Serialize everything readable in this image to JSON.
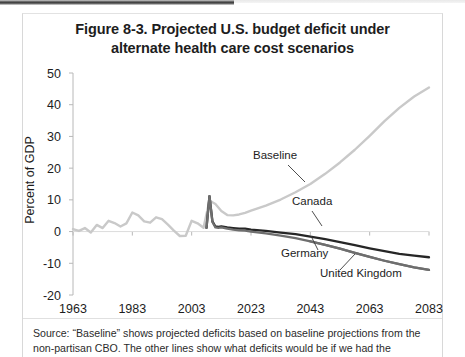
{
  "document": {
    "source_note": "Source: “Baseline” shows projected deficits based on baseline projections from the non-partisan CBO. The other lines show what deficits would be if we had the"
  },
  "chart_data": {
    "type": "line",
    "title": "Figure 8-3. Projected U.S. budget deficit under alternate health care cost scenarios",
    "title_line_1": "Figure 8-3. Projected U.S. budget deficit under",
    "title_line_2": "alternate health care cost scenarios",
    "xlabel": "",
    "ylabel": "Percent of GDP",
    "xlim": [
      1963,
      2083
    ],
    "ylim": [
      -20,
      50
    ],
    "xticks": [
      1963,
      1983,
      2003,
      2023,
      2043,
      2063,
      2083
    ],
    "yticks": [
      50,
      40,
      30,
      20,
      10,
      0,
      -10,
      -20
    ],
    "grid": false,
    "zero_line": 0,
    "legend": "inline-annotations",
    "colors": {
      "baseline": "#c9c9c9",
      "canada": "#262626",
      "germany": "#6e6e6e",
      "united_kingdom": "#6e6e6e",
      "axis": "#b8b8b8",
      "text": "#1d1d1d"
    },
    "annotations": [
      {
        "label": "Baseline",
        "x": 253,
        "y": 159
      },
      {
        "label": "Canada",
        "x": 292,
        "y": 205
      },
      {
        "label": "Germany",
        "x": 281,
        "y": 257
      },
      {
        "label": "United Kingdom",
        "x": 320,
        "y": 277
      }
    ],
    "series": [
      {
        "name": "Baseline",
        "color": "#c9c9c9",
        "x": [
          1963,
          1965,
          1967,
          1969,
          1971,
          1973,
          1975,
          1977,
          1979,
          1981,
          1983,
          1985,
          1987,
          1989,
          1991,
          1993,
          1995,
          1997,
          1999,
          2001,
          2003,
          2005,
          2007,
          2009,
          2011,
          2013,
          2015,
          2017,
          2019,
          2021,
          2023,
          2028,
          2033,
          2038,
          2043,
          2048,
          2053,
          2058,
          2063,
          2068,
          2073,
          2078,
          2083
        ],
        "values": [
          0.8,
          0.2,
          1.1,
          -0.3,
          2.1,
          1.1,
          3.4,
          2.7,
          1.6,
          2.6,
          6.0,
          5.1,
          3.2,
          2.8,
          4.5,
          3.9,
          2.2,
          0.3,
          -1.4,
          -1.3,
          3.4,
          2.6,
          1.2,
          9.8,
          8.7,
          6.5,
          5.2,
          5.1,
          5.4,
          5.9,
          6.6,
          8.2,
          10.1,
          12.4,
          15.0,
          18.2,
          21.8,
          25.8,
          30.2,
          34.8,
          39.0,
          42.6,
          45.4
        ]
      },
      {
        "name": "Canada",
        "color": "#262626",
        "x": [
          2008,
          2009,
          2010,
          2011,
          2012,
          2013,
          2015,
          2017,
          2019,
          2021,
          2023,
          2028,
          2033,
          2038,
          2043,
          2048,
          2053,
          2058,
          2063,
          2068,
          2073,
          2078,
          2083
        ],
        "values": [
          1.2,
          11.2,
          3.2,
          1.6,
          1.5,
          1.6,
          1.3,
          1.1,
          0.9,
          0.9,
          0.6,
          0.2,
          -0.3,
          -0.8,
          -1.6,
          -2.4,
          -3.3,
          -4.3,
          -5.3,
          -6.2,
          -7.0,
          -7.6,
          -8.1
        ]
      },
      {
        "name": "Germany",
        "color": "#6e6e6e",
        "x": [
          2008,
          2009,
          2010,
          2011,
          2012,
          2013,
          2015,
          2017,
          2019,
          2021,
          2023,
          2028,
          2033,
          2038,
          2043,
          2048,
          2053,
          2058,
          2063,
          2068,
          2073,
          2078,
          2083
        ],
        "values": [
          1.2,
          11.2,
          3.0,
          1.3,
          1.2,
          1.3,
          0.9,
          0.6,
          0.4,
          0.3,
          0.0,
          -0.6,
          -1.3,
          -2.1,
          -3.1,
          -4.2,
          -5.4,
          -6.7,
          -8.0,
          -9.2,
          -10.3,
          -11.3,
          -12.1
        ]
      },
      {
        "name": "United Kingdom",
        "color": "#6e6e6e",
        "x": [
          2043,
          2048,
          2053,
          2058,
          2063,
          2068,
          2073,
          2078,
          2083
        ],
        "values": [
          -3.1,
          -4.2,
          -5.4,
          -6.7,
          -8.0,
          -9.2,
          -10.3,
          -11.3,
          -12.1
        ]
      }
    ]
  }
}
